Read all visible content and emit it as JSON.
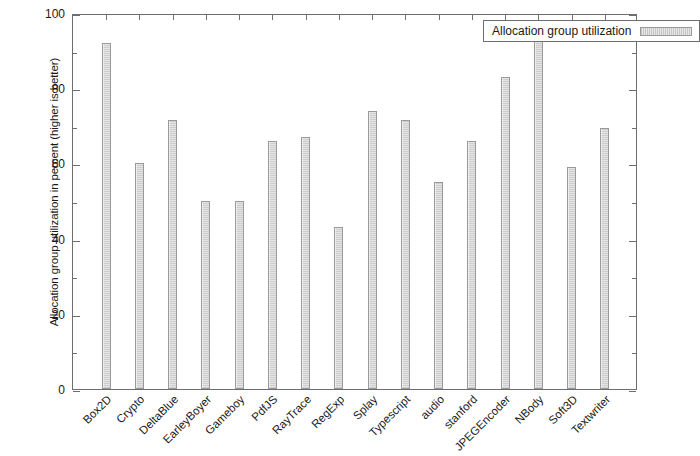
{
  "chart_data": {
    "type": "bar",
    "title": "",
    "xlabel": "",
    "ylabel": "Allocation group utilization in percent (higher is better)",
    "ylim": [
      0,
      100
    ],
    "grid": false,
    "legend_position": "top-right",
    "y_ticks": [
      0,
      20,
      40,
      60,
      80,
      100
    ],
    "y_minor_ticks": [
      10,
      30,
      50,
      70,
      90
    ],
    "categories": [
      "Box2D",
      "Crypto",
      "DeltaBlue",
      "EarleyBoyer",
      "Gameboy",
      "PdfJS",
      "RayTrace",
      "RegExp",
      "Splay",
      "Typescript",
      "audio",
      "stanford",
      "JPEGEncoder",
      "NBody",
      "Soft3D",
      "Textwriter"
    ],
    "series": [
      {
        "name": "Allocation group utilization",
        "values": [
          92,
          60,
          71.5,
          50,
          50,
          66,
          67,
          43,
          74,
          71.5,
          55,
          66,
          83,
          94,
          59,
          69.5
        ]
      }
    ],
    "colors": {
      "bar_fill": "#dcdcdc",
      "bar_border": "#9a9a9a",
      "axis": "#6e6e6e",
      "text": "#1a1a1a",
      "background": "#ffffff"
    }
  },
  "legend": {
    "entries": [
      {
        "label": "Allocation group utilization",
        "swatch": "bar-swatch"
      }
    ]
  }
}
